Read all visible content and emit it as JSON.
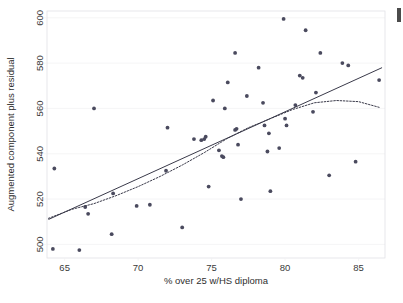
{
  "figure": {
    "background_color": "#ffffff",
    "marker_color": "#4a4a5e",
    "line_color": "#3a3a4a",
    "grid_color": "#f0f0f2",
    "frame_color": "#e2e2e6"
  },
  "chart_data": {
    "type": "scatter",
    "title": "",
    "subtitle": "",
    "xlabel": "% over 25 w/HS diploma",
    "ylabel": "Augmented component plus residual",
    "xlim": [
      63.8,
      86.8
    ],
    "ylim": [
      494,
      603
    ],
    "xticks": [
      65,
      70,
      75,
      80,
      85
    ],
    "yticks": [
      500,
      520,
      540,
      560,
      580,
      600
    ],
    "xtick_labels": [
      "65",
      "70",
      "75",
      "80",
      "85"
    ],
    "ytick_labels": [
      "500",
      "520",
      "540",
      "560",
      "580",
      "600"
    ],
    "grid": true,
    "grid_axis": "y",
    "legend": null,
    "legend_position": "none",
    "annotations": [],
    "points": [
      [
        64.2,
        498.0
      ],
      [
        64.3,
        533.5
      ],
      [
        66.0,
        497.5
      ],
      [
        66.4,
        516.5
      ],
      [
        66.6,
        513.5
      ],
      [
        67.0,
        560.0
      ],
      [
        68.2,
        504.5
      ],
      [
        68.3,
        522.5
      ],
      [
        69.9,
        517.0
      ],
      [
        70.8,
        517.5
      ],
      [
        71.9,
        532.5
      ],
      [
        72.0,
        551.5
      ],
      [
        73.0,
        507.5
      ],
      [
        73.8,
        546.5
      ],
      [
        74.3,
        546.0
      ],
      [
        74.5,
        546.5
      ],
      [
        74.6,
        547.5
      ],
      [
        74.8,
        525.5
      ],
      [
        75.1,
        563.5
      ],
      [
        75.5,
        541.5
      ],
      [
        75.7,
        539.0
      ],
      [
        75.8,
        538.5
      ],
      [
        75.9,
        560.0
      ],
      [
        76.1,
        571.5
      ],
      [
        76.6,
        584.5
      ],
      [
        76.6,
        550.5
      ],
      [
        76.7,
        551.0
      ],
      [
        76.8,
        544.0
      ],
      [
        77.0,
        520.0
      ],
      [
        77.4,
        565.5
      ],
      [
        78.2,
        578.0
      ],
      [
        78.5,
        562.5
      ],
      [
        78.6,
        552.5
      ],
      [
        78.8,
        541.0
      ],
      [
        78.9,
        549.0
      ],
      [
        79.0,
        523.5
      ],
      [
        79.6,
        542.5
      ],
      [
        79.9,
        599.5
      ],
      [
        80.0,
        555.5
      ],
      [
        80.1,
        552.5
      ],
      [
        80.7,
        561.5
      ],
      [
        81.0,
        574.5
      ],
      [
        81.2,
        573.5
      ],
      [
        81.4,
        594.5
      ],
      [
        81.9,
        558.5
      ],
      [
        82.1,
        567.0
      ],
      [
        82.4,
        584.5
      ],
      [
        83.0,
        530.5
      ],
      [
        83.9,
        580.0
      ],
      [
        84.3,
        579.0
      ],
      [
        84.8,
        536.5
      ],
      [
        86.4,
        572.5
      ]
    ],
    "series": [
      {
        "name": "linear fit",
        "type": "line",
        "style": "solid",
        "x": [
          63.9,
          86.6
        ],
        "y": [
          511.0,
          578.0
        ]
      },
      {
        "name": "lowess fit",
        "type": "line",
        "style": "dotted",
        "points": [
          [
            63.9,
            511.5
          ],
          [
            65.5,
            515.5
          ],
          [
            67.0,
            518.0
          ],
          [
            68.5,
            521.5
          ],
          [
            70.0,
            525.5
          ],
          [
            71.5,
            530.0
          ],
          [
            73.0,
            535.0
          ],
          [
            74.5,
            540.5
          ],
          [
            76.0,
            546.5
          ],
          [
            77.5,
            551.5
          ],
          [
            79.0,
            555.5
          ],
          [
            80.5,
            559.5
          ],
          [
            82.0,
            562.5
          ],
          [
            83.5,
            563.5
          ],
          [
            85.0,
            563.0
          ],
          [
            86.4,
            560.5
          ]
        ]
      }
    ]
  }
}
